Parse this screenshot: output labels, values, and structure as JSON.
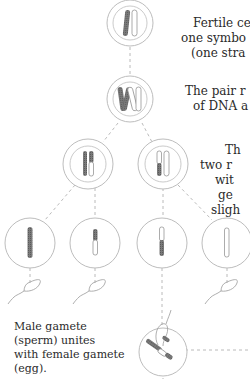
{
  "labels": {
    "fertile_cell": {
      "lines": [
        "Fertile cel",
        "one symbo",
        "(one stra"
      ]
    },
    "pair_replicates": {
      "lines": [
        "The pair r",
        "of DNA a"
      ]
    },
    "two_divisions": {
      "lines": [
        "Th",
        "two r",
        "wit",
        "ge",
        "sligh"
      ]
    },
    "fertilization": {
      "lines": [
        "Male gamete",
        "(sperm) unites",
        "with female gamete",
        "(egg)."
      ]
    }
  },
  "colors": {
    "line": "#9a9a9a",
    "ring": "#bdbdbd",
    "chromosome_dark": "#6b6b6b",
    "chromosome_light": "#ffffff",
    "text": "#2a2a2a"
  }
}
